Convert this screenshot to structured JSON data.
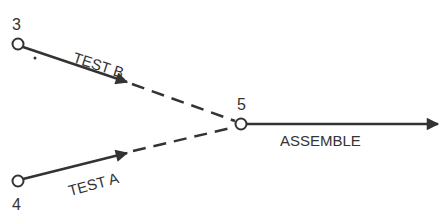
{
  "diagram": {
    "colors": {
      "line": "#333333",
      "background": "#ffffff"
    },
    "nodes": [
      {
        "id": "3",
        "label": "3"
      },
      {
        "id": "4",
        "label": "4"
      },
      {
        "id": "5",
        "label": "5"
      }
    ],
    "edges": [
      {
        "from": "3",
        "to": "5",
        "label": "TEST B",
        "style": "solid-then-dashed"
      },
      {
        "from": "4",
        "to": "5",
        "label": "TEST A",
        "style": "solid-then-dashed"
      },
      {
        "from": "5",
        "to": "out",
        "label": "ASSEMBLE",
        "style": "solid"
      }
    ]
  }
}
